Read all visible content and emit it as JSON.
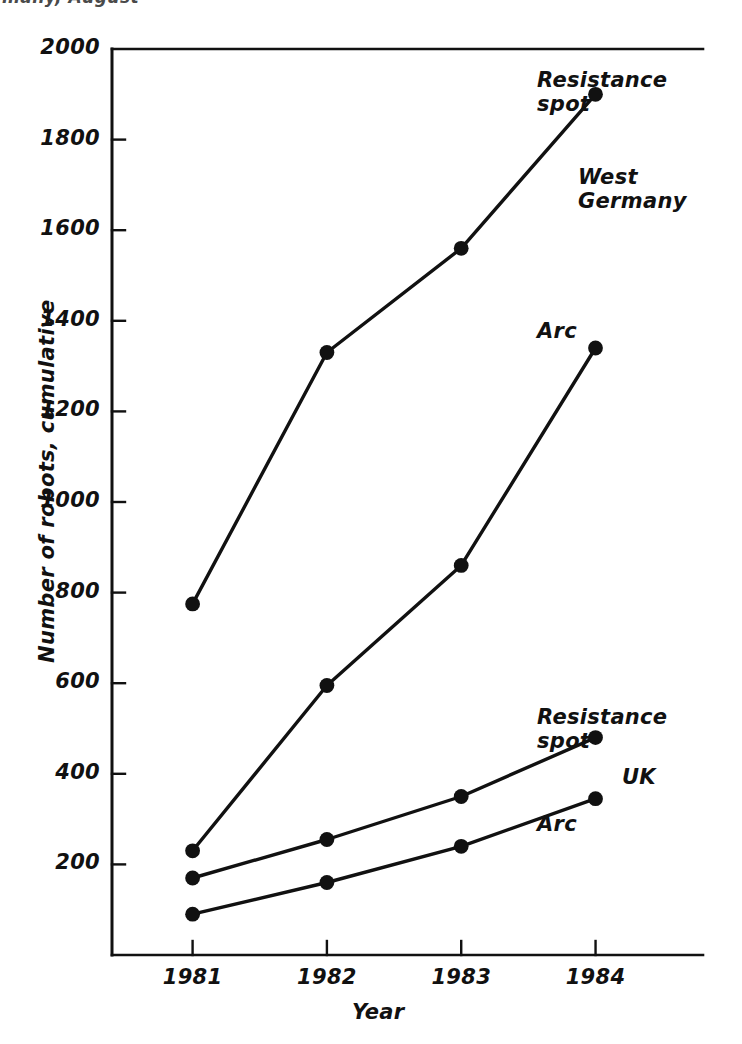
{
  "caption": {
    "text": "many, August"
  },
  "chart_data": {
    "type": "line",
    "title": "",
    "xlabel": "Year",
    "ylabel": "Number of robots, cumulative",
    "x": [
      1981,
      1982,
      1983,
      1984
    ],
    "categories": [
      "1981",
      "1982",
      "1983",
      "1984"
    ],
    "xtick_labels": [
      "1981",
      "1982",
      "1983",
      "1984"
    ],
    "ytick_labels": [
      "200",
      "400",
      "600",
      "800",
      "1000",
      "1200",
      "1400",
      "1600",
      "1800",
      "2000"
    ],
    "ytick_values": [
      200,
      400,
      600,
      800,
      1000,
      1200,
      1400,
      1600,
      1800,
      2000
    ],
    "ylim": [
      0,
      2000
    ],
    "xlim": [
      1980.4,
      1984.8
    ],
    "grid": false,
    "legend_position": "inline-annotations",
    "marker": "filled-circle",
    "series": [
      {
        "name": "West Germany Resistance spot",
        "label": "Resistance spot",
        "region": "West Germany",
        "process": "Resistance spot",
        "values": [
          775,
          1330,
          1560,
          1900
        ]
      },
      {
        "name": "West Germany Arc",
        "label": "Arc",
        "region": "West Germany",
        "process": "Arc",
        "values": [
          230,
          595,
          860,
          1340
        ]
      },
      {
        "name": "UK Resistance spot",
        "label": "Resistance spot",
        "region": "UK",
        "process": "Resistance spot",
        "values": [
          170,
          255,
          350,
          480
        ]
      },
      {
        "name": "UK Arc",
        "label": "Arc",
        "region": "UK",
        "process": "Arc",
        "values": [
          90,
          160,
          240,
          345
        ]
      }
    ],
    "annotations": [
      {
        "text": "Resistance spot",
        "line1": "Resistance",
        "line2": "spot",
        "for": "West Germany Resistance spot"
      },
      {
        "text": "West Germany",
        "line1": "West",
        "line2": "Germany",
        "for": "region-west-germany"
      },
      {
        "text": "Arc",
        "line1": "Arc",
        "line2": "",
        "for": "West Germany Arc"
      },
      {
        "text": "Resistance spot",
        "line1": "Resistance",
        "line2": "spot",
        "for": "UK Resistance spot"
      },
      {
        "text": "UK",
        "line1": "UK",
        "line2": "",
        "for": "region-uk"
      },
      {
        "text": "Arc",
        "line1": "Arc",
        "line2": "",
        "for": "UK Arc"
      }
    ],
    "colors": {
      "line": "#111111",
      "marker": "#111111",
      "axis": "#111111",
      "background": "#ffffff"
    }
  }
}
